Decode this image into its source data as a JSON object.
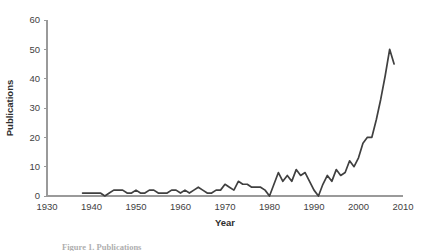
{
  "figure": {
    "caption": "Figure 1. Publications"
  },
  "chart_data": {
    "type": "line",
    "title": "",
    "xlabel": "Year",
    "ylabel": "Publications",
    "xlim": [
      1930,
      2010
    ],
    "ylim": [
      0,
      60
    ],
    "grid": false,
    "legend": null,
    "x_ticks": [
      1930,
      1940,
      1950,
      1960,
      1970,
      1980,
      1990,
      2000,
      2010
    ],
    "y_ticks": [
      0,
      10,
      20,
      30,
      40,
      50,
      60
    ],
    "series": [
      {
        "name": "Publications",
        "color": "#404040",
        "x": [
          1938,
          1939,
          1940,
          1941,
          1942,
          1943,
          1944,
          1945,
          1946,
          1947,
          1948,
          1949,
          1950,
          1951,
          1952,
          1953,
          1954,
          1955,
          1956,
          1957,
          1958,
          1959,
          1960,
          1961,
          1962,
          1963,
          1964,
          1965,
          1966,
          1967,
          1968,
          1969,
          1970,
          1971,
          1972,
          1973,
          1974,
          1975,
          1976,
          1977,
          1978,
          1979,
          1980,
          1981,
          1982,
          1983,
          1984,
          1985,
          1986,
          1987,
          1988,
          1989,
          1990,
          1991,
          1992,
          1993,
          1994,
          1995,
          1996,
          1997,
          1998,
          1999,
          2000,
          2001,
          2002,
          2003,
          2004,
          2005,
          2006,
          2007,
          2008
        ],
        "values": [
          1,
          1,
          1,
          1,
          1,
          0,
          1,
          2,
          2,
          2,
          1,
          1,
          2,
          1,
          1,
          2,
          2,
          1,
          1,
          1,
          2,
          2,
          1,
          2,
          1,
          2,
          3,
          2,
          1,
          1,
          2,
          2,
          4,
          3,
          2,
          5,
          4,
          4,
          3,
          3,
          3,
          2,
          0,
          4,
          8,
          5,
          7,
          5,
          9,
          7,
          8,
          5,
          2,
          0,
          4,
          7,
          5,
          9,
          7,
          8,
          12,
          10,
          13,
          18,
          20,
          20,
          26,
          33,
          41,
          50,
          45
        ]
      }
    ]
  }
}
